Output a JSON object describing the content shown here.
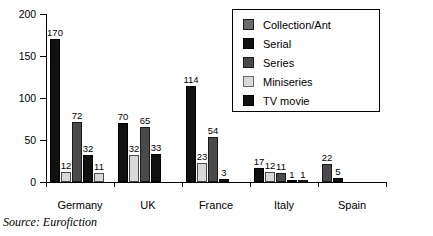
{
  "chart_data": {
    "type": "bar",
    "title": "",
    "subtitle": "",
    "xlabel": "",
    "ylabel": "",
    "ylim": [
      0,
      200
    ],
    "yticks": [
      0,
      50,
      100,
      150,
      200
    ],
    "grid": false,
    "legend_position": "top-right",
    "categories": [
      "Germany",
      "UK",
      "France",
      "Italy",
      "Spain"
    ],
    "series": [
      {
        "name": "Collection/Ant",
        "color": "#6b6b6b",
        "values": [
          null,
          null,
          null,
          null,
          null
        ]
      },
      {
        "name": "Serial",
        "color": "#111111",
        "values": [
          170,
          70,
          114,
          17,
          null
        ]
      },
      {
        "name": "Series",
        "color": "#4a4a4a",
        "values": [
          72,
          65,
          54,
          11,
          22
        ]
      },
      {
        "name": "Miniseries",
        "color": "#d8d8d8",
        "values": [
          12,
          32,
          23,
          12,
          null
        ]
      },
      {
        "name": "TV movie",
        "color": "#111111",
        "values": [
          32,
          33,
          3,
          1,
          5
        ]
      }
    ],
    "bars": [
      {
        "group": "Germany",
        "series": "Serial",
        "value": 170,
        "label": "170"
      },
      {
        "group": "Germany",
        "series": "Miniseries",
        "value": 12,
        "label": "12"
      },
      {
        "group": "Germany",
        "series": "Series",
        "value": 72,
        "label": "72"
      },
      {
        "group": "Germany",
        "series": "TV movie",
        "value": 32,
        "label": "32"
      },
      {
        "group": "Germany",
        "series": "Miniseries",
        "value": 11,
        "label": "11"
      },
      {
        "group": "UK",
        "series": "Serial",
        "value": 70,
        "label": "70"
      },
      {
        "group": "UK",
        "series": "Miniseries",
        "value": 32,
        "label": "32"
      },
      {
        "group": "UK",
        "series": "Series",
        "value": 65,
        "label": "65"
      },
      {
        "group": "UK",
        "series": "TV movie",
        "value": 33,
        "label": "33"
      },
      {
        "group": "France",
        "series": "Serial",
        "value": 114,
        "label": "114"
      },
      {
        "group": "France",
        "series": "Miniseries",
        "value": 23,
        "label": "23"
      },
      {
        "group": "France",
        "series": "Series",
        "value": 54,
        "label": "54"
      },
      {
        "group": "France",
        "series": "TV movie",
        "value": 3,
        "label": "3"
      },
      {
        "group": "Italy",
        "series": "Serial",
        "value": 17,
        "label": "17"
      },
      {
        "group": "Italy",
        "series": "Miniseries",
        "value": 12,
        "label": "12"
      },
      {
        "group": "Italy",
        "series": "Series",
        "value": 11,
        "label": "11"
      },
      {
        "group": "Italy",
        "series": "TV movie",
        "value": 1,
        "label": "1"
      },
      {
        "group": "Italy",
        "series": "Collection/Ant",
        "value": 1,
        "label": "1"
      },
      {
        "group": "Spain",
        "series": "Series",
        "value": 22,
        "label": "22"
      },
      {
        "group": "Spain",
        "series": "TV movie",
        "value": 5,
        "label": "5"
      }
    ]
  },
  "axis": {
    "y_tick_labels": [
      "0",
      "50",
      "100",
      "150",
      "200"
    ],
    "x_tick_labels": [
      "Germany",
      "UK",
      "France",
      "Italy",
      "Spain"
    ]
  },
  "legend": {
    "items": [
      {
        "label": "Collection/Ant",
        "swatch": "collection"
      },
      {
        "label": "Serial",
        "swatch": "serial"
      },
      {
        "label": "Series",
        "swatch": "series"
      },
      {
        "label": "Miniseries",
        "swatch": "mini"
      },
      {
        "label": "TV movie",
        "swatch": "tvmovie"
      }
    ]
  },
  "footer": {
    "source": "Source: Eurofiction"
  }
}
